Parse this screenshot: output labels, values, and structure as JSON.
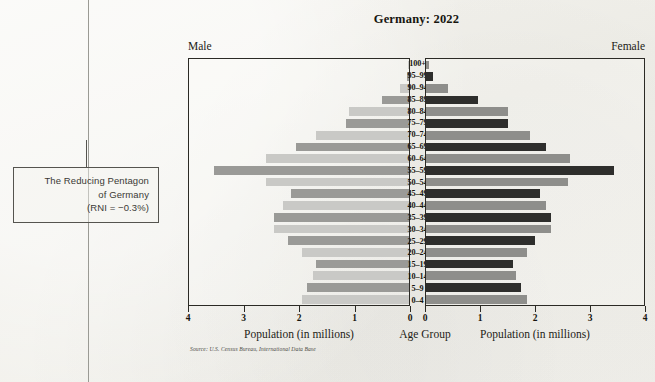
{
  "annotation": {
    "line1": "The Reducing Pentagon",
    "line2": "of Germany",
    "line3": "(RNI = −0.3%)"
  },
  "labels": {
    "male": "Male",
    "female": "Female",
    "age_group_axis": "Age Group",
    "population_axis": "Population (in millions)",
    "source": "Source: U.S. Census Bureau, International Data Base"
  },
  "colors": {
    "male_light": "#c9c9c6",
    "male_dark": "#9a9a97",
    "female_light": "#8e8e8b",
    "female_dark": "#2e2e2c",
    "axis": "#2b2a25",
    "page": "#f2f1ec"
  },
  "chart_data": {
    "type": "bar",
    "title": "Germany: 2022",
    "subtitle": "",
    "xlabel": "Population (in millions)",
    "ylabel": "Age Group",
    "xlim": [
      0,
      4
    ],
    "grid": false,
    "legend": [
      "Male",
      "Female"
    ],
    "orientation": "population-pyramid",
    "tick_labels_left": [
      "4",
      "3",
      "2",
      "1",
      "0"
    ],
    "tick_labels_right": [
      "0",
      "1",
      "2",
      "3",
      "4"
    ],
    "categories": [
      "100+",
      "95–99",
      "90–94",
      "85–89",
      "80–84",
      "75–79",
      "70–74",
      "65–69",
      "60–64",
      "55–59",
      "50–54",
      "45–49",
      "40–44",
      "35–39",
      "30–34",
      "25–29",
      "20–24",
      "15–19",
      "10–14",
      "5–9",
      "0–4"
    ],
    "series": [
      {
        "name": "Male",
        "side": "left",
        "values": [
          0.01,
          0.04,
          0.16,
          0.5,
          1.1,
          1.15,
          1.7,
          2.05,
          2.6,
          3.55,
          2.6,
          2.15,
          2.3,
          2.45,
          2.45,
          2.2,
          1.95,
          1.7,
          1.75,
          1.85,
          1.95
        ]
      },
      {
        "name": "Female",
        "side": "right",
        "values": [
          0.05,
          0.13,
          0.4,
          0.95,
          1.5,
          1.5,
          1.9,
          2.2,
          2.65,
          3.45,
          2.6,
          2.1,
          2.2,
          2.3,
          2.3,
          2.0,
          1.85,
          1.6,
          1.65,
          1.75,
          1.85
        ]
      }
    ]
  }
}
